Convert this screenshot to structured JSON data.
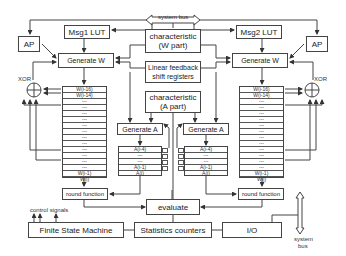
{
  "diagram": {
    "system_bus_top": "system bus",
    "msg1_lut": "Msg1 LUT",
    "msg2_lut": "Msg2 LUT",
    "ap_left": "AP",
    "ap_right": "AP",
    "char_w": "characteristic\n(W part)",
    "char_w_line1": "characteristic",
    "char_w_line2": "(W part)",
    "lfsr_line1": "Linear feedback",
    "lfsr_line2": "shift registers",
    "char_a_line1": "characteristic",
    "char_a_line2": "(A part)",
    "generate_w_left": "Generate W",
    "generate_w_right": "Generate W",
    "generate_a_left": "Generate A",
    "generate_a_right": "Generate A",
    "xor_left": "XOR",
    "xor_right": "XOR",
    "w_register": [
      "W(i-16)",
      "W(i-14)",
      "---",
      "---",
      "---",
      "---",
      "---",
      "---",
      "---",
      "---",
      "---",
      "---",
      "---",
      "---",
      "W(i-1)",
      "W(i)"
    ],
    "a_register": [
      "A(i-4)",
      "---",
      "---",
      "A(i-1)",
      "A(i)"
    ],
    "round_function_left": "round function",
    "round_function_right": "round function",
    "evaluate": "evaluate",
    "control_signals": "control signals",
    "fsm": "Finite State Machine",
    "stats": "Statistics counters",
    "io": "I/O",
    "system_bus_bottom_1": "system",
    "system_bus_bottom_2": "bus"
  }
}
